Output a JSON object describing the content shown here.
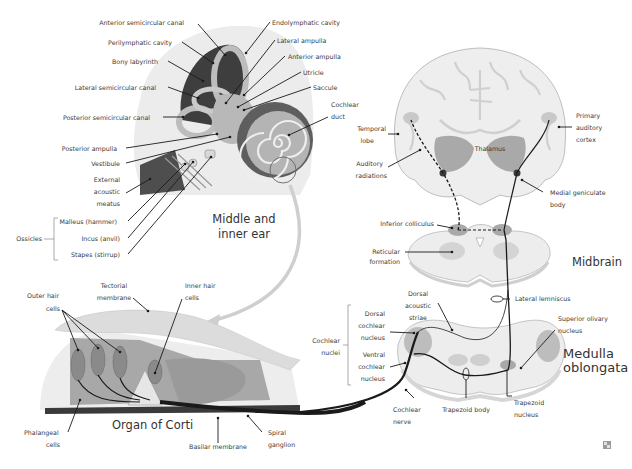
{
  "diagram": {
    "sections": {
      "ear": "Middle and inner ear",
      "ear_line1": "Middle and",
      "ear_line2": "inner ear",
      "corti": "Organ of Corti",
      "midbrain": "Midbrain",
      "medulla_line1": "Medulla",
      "medulla_line2": "oblongata"
    },
    "ear_labels": {
      "anterior_semicircular_canal": "Anterior semicircular canal",
      "perilymphatic_cavity": "Perilymphatic cavity",
      "bony_labyrinth": "Bony labyrinth",
      "lateral_semicircular_canal": "Lateral semicircular canal",
      "posterior_semicircular_canal": "Posterior semicircular canal",
      "posterior_ampulla": "Posterior ampulla",
      "vestibule": "Vestibule",
      "external_acoustic_meatus": [
        "External",
        "acoustic",
        "meatus"
      ],
      "ossicles": "Ossicles",
      "malleus": "Malleus (hammer)",
      "incus": "Incus (anvil)",
      "stapes": "Stapes (stirrup)",
      "endolymphatic_cavity": "Endolymphatic cavity",
      "lateral_ampulla": "Lateral ampulla",
      "anterior_ampulla": "Anterior ampulla",
      "utricle": "Utricle",
      "saccule": "Saccule",
      "cochlear_duct": [
        "Cochlear",
        "duct"
      ]
    },
    "corti_labels": {
      "outer_hair_cells": [
        "Outer hair",
        "cells"
      ],
      "tectorial_membrane": [
        "Tectorial",
        "membrane"
      ],
      "inner_hair_cells": [
        "Inner hair",
        "cells"
      ],
      "phalangeal_cells": [
        "Phalangeal",
        "cells"
      ],
      "basilar_membrane": "Basilar membrane",
      "spiral_ganglion": [
        "Spiral",
        "ganglion"
      ]
    },
    "brain_labels": {
      "temporal_lobe": [
        "Temporal",
        "lobe"
      ],
      "auditory_radiations": [
        "Auditory",
        "radiations"
      ],
      "thalamus": "Thalamus",
      "primary_auditory_cortex": [
        "Primary",
        "auditory",
        "cortex"
      ],
      "medial_geniculate_body": [
        "Medial geniculate",
        "body"
      ],
      "inferior_colliculus": "Inferior colliculus",
      "reticular_formation": [
        "Reticular",
        "formation"
      ],
      "lateral_lemniscus": "Lateral lemniscus",
      "dorsal_acoustic_striae": [
        "Dorsal",
        "acoustic",
        "striae"
      ],
      "cochlear_nuclei": [
        "Cochlear",
        "nuclei"
      ],
      "dorsal_cochlear_nucleus": [
        "Dorsal",
        "cochlear",
        "nucleus"
      ],
      "ventral_cochlear_nucleus": [
        "Ventral",
        "cochlear",
        "nucleus"
      ],
      "superior_olivary_nucleus": [
        "Superior olivary",
        "nucleus"
      ],
      "trapezoid_body": "Trapezoid body",
      "trapezoid_nucleus": [
        "Trapezoid",
        "nucleus"
      ],
      "cochlear_nerve": [
        "Cochlear",
        "nerve"
      ]
    },
    "colors": {
      "light_gray": "#e6e6e6",
      "mid_gray": "#c4c4c4",
      "dark_gray": "#5a5a5a",
      "nerve": "#1a1a1a",
      "arrow": "#cfcfcf"
    }
  }
}
